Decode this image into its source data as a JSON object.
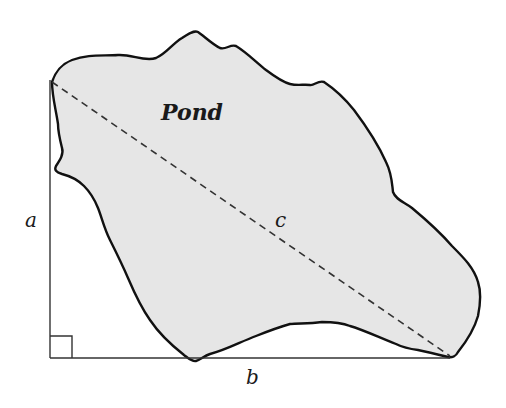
{
  "diagram": {
    "title_label": "Pond",
    "labels": {
      "a": "a",
      "b": "b",
      "c": "c"
    },
    "colors": {
      "pond_fill": "#e6e6e6",
      "pond_stroke": "#111111",
      "line": "#333333",
      "dashed": "#333333",
      "text": "#1a1a1a",
      "background": "#ffffff"
    },
    "geometry": {
      "right_angle_vertex": [
        50,
        358
      ],
      "leg_a_top": [
        50,
        80
      ],
      "leg_b_end": [
        450,
        358
      ],
      "hypotenuse_start": [
        52,
        82
      ],
      "hypotenuse_end": [
        450,
        356
      ],
      "right_angle_box_size": 22
    }
  }
}
